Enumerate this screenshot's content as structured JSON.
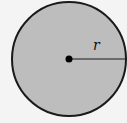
{
  "diagram": {
    "shape": "circle",
    "fill_color": "#bdbdbd",
    "stroke_color": "#1a1a1a",
    "background_color": "#f4f4f4",
    "radius_label": "r",
    "center_point": "center"
  }
}
